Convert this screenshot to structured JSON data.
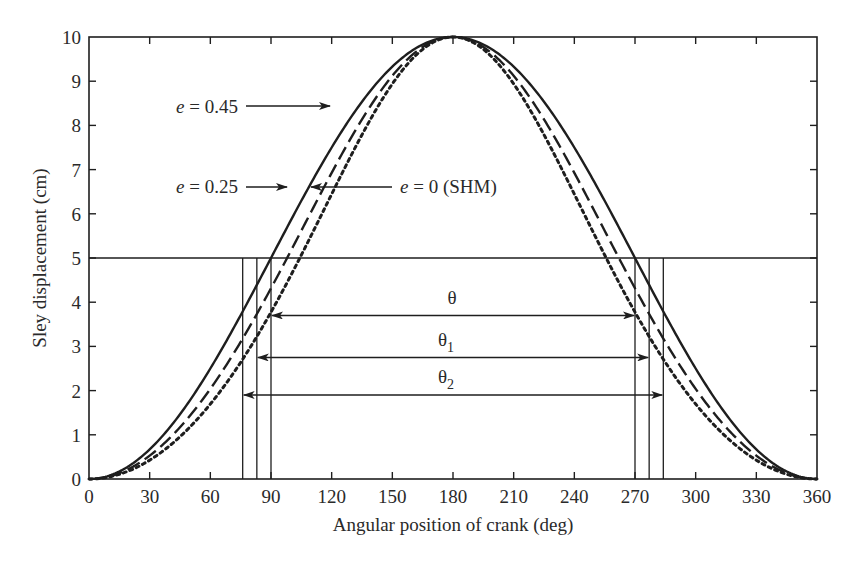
{
  "chart_data": {
    "type": "line",
    "title": "",
    "xlabel": "Angular position of crank (deg)",
    "ylabel": "Sley displacement (cm)",
    "xlim": [
      0,
      360
    ],
    "ylim": [
      0,
      10
    ],
    "xticks": [
      0,
      30,
      60,
      90,
      120,
      150,
      180,
      210,
      240,
      270,
      300,
      330,
      360
    ],
    "yticks": [
      0,
      1,
      2,
      3,
      4,
      5,
      6,
      7,
      8,
      9,
      10
    ],
    "grid": false,
    "legend": "none (inline arrow annotations)",
    "stroke_amplitude_cm": 10,
    "series": [
      {
        "name": "e = 0 (SHM)",
        "eccentricity": 0,
        "style": "solid",
        "x": [
          0,
          30,
          60,
          90,
          120,
          150,
          180,
          210,
          240,
          270,
          300,
          330,
          360
        ],
        "values": [
          0,
          0.67,
          2.5,
          5.0,
          7.5,
          9.33,
          10,
          9.33,
          7.5,
          5.0,
          2.5,
          0.67,
          0
        ]
      },
      {
        "name": "e = 0.25",
        "eccentricity": 0.25,
        "style": "dashed",
        "x": [
          0,
          30,
          60,
          90,
          120,
          150,
          180,
          210,
          240,
          270,
          300,
          330,
          360
        ],
        "values": [
          0,
          0.83,
          3.05,
          5.9,
          8.1,
          9.5,
          10,
          9.5,
          8.1,
          5.9,
          3.05,
          0.83,
          0
        ]
      },
      {
        "name": "e = 0.45",
        "eccentricity": 0.45,
        "style": "dotted",
        "x": [
          0,
          30,
          60,
          90,
          120,
          150,
          180,
          210,
          240,
          270,
          300,
          330,
          360
        ],
        "values": [
          0,
          0.95,
          3.5,
          6.5,
          8.5,
          9.65,
          10,
          9.65,
          8.5,
          6.5,
          3.5,
          0.95,
          0
        ]
      }
    ],
    "reference_line": {
      "y": 5,
      "style": "solid-thin"
    },
    "verticals": {
      "e0": [
        90,
        270
      ],
      "e025": [
        83,
        277
      ],
      "e045": [
        76,
        284
      ]
    },
    "dimension_arrows": [
      {
        "label": "θ",
        "from": 90,
        "to": 270,
        "y": 3.7
      },
      {
        "label": "θ1",
        "from": 83,
        "to": 277,
        "y": 2.75
      },
      {
        "label": "θ2",
        "from": 76,
        "to": 284,
        "y": 1.9
      }
    ],
    "annotations": [
      {
        "text_prefix": "e",
        "text_suffix": " = 0.45",
        "points_to": "e = 0.45 curve",
        "arrow": "right"
      },
      {
        "text_prefix": "e",
        "text_suffix": " = 0.25",
        "points_to": "e = 0.25 curve",
        "arrow": "right"
      },
      {
        "text_prefix": "e",
        "text_suffix": " = 0 (SHM)",
        "points_to": "e = 0 curve",
        "arrow": "left"
      }
    ]
  },
  "labels": {
    "theta": "θ",
    "theta1_base": "θ",
    "theta1_sub": "1",
    "theta2_base": "θ",
    "theta2_sub": "2",
    "ann045_e": "e",
    "ann045_rest": " = 0.45",
    "ann025_e": "e",
    "ann025_rest": " = 0.25",
    "ann0_e": "e",
    "ann0_rest": " = 0 (SHM)"
  },
  "colors": {
    "ink": "#1e1e1e",
    "background": "#ffffff"
  }
}
